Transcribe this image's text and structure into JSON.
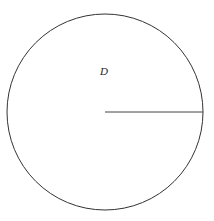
{
  "diagram": {
    "type": "circle-with-radius",
    "region_label": "D",
    "circle": {
      "cx": 105,
      "cy": 112,
      "r": 98,
      "stroke": "#333333"
    },
    "radius_line": {
      "x1": 105,
      "y1": 112,
      "x2": 203,
      "y2": 112,
      "stroke": "#444444"
    },
    "label_position": {
      "x": 100,
      "y": 75
    }
  }
}
